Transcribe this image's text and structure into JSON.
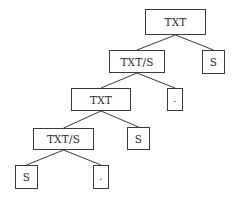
{
  "diagram": {
    "type": "tree",
    "nodes": [
      {
        "id": "n1",
        "label": "TXT",
        "x": 145,
        "y": 9,
        "w": 61,
        "h": 26
      },
      {
        "id": "n2",
        "label": "TXT/S",
        "x": 109,
        "y": 50,
        "w": 56,
        "h": 23
      },
      {
        "id": "n3",
        "label": "S",
        "x": 202,
        "y": 50,
        "w": 23,
        "h": 24
      },
      {
        "id": "n4",
        "label": "TXT",
        "x": 71,
        "y": 88,
        "w": 60,
        "h": 23
      },
      {
        "id": "n5",
        "label": ".",
        "x": 167,
        "y": 88,
        "w": 16,
        "h": 23
      },
      {
        "id": "n6",
        "label": "TXT/S",
        "x": 33,
        "y": 128,
        "w": 61,
        "h": 22
      },
      {
        "id": "n7",
        "label": "S",
        "x": 127,
        "y": 127,
        "w": 23,
        "h": 23
      },
      {
        "id": "n8",
        "label": "S",
        "x": 15,
        "y": 165,
        "w": 23,
        "h": 24
      },
      {
        "id": "n9",
        "label": ".",
        "x": 93,
        "y": 165,
        "w": 16,
        "h": 24
      }
    ],
    "edges": [
      {
        "from": "n1",
        "to": "n2"
      },
      {
        "from": "n1",
        "to": "n3"
      },
      {
        "from": "n2",
        "to": "n4"
      },
      {
        "from": "n2",
        "to": "n5"
      },
      {
        "from": "n4",
        "to": "n6"
      },
      {
        "from": "n4",
        "to": "n7"
      },
      {
        "from": "n6",
        "to": "n8"
      },
      {
        "from": "n6",
        "to": "n9"
      }
    ],
    "colors": {
      "line": "#3a3a3a",
      "text": "#2a2a2a",
      "background": "#ffffff"
    }
  }
}
